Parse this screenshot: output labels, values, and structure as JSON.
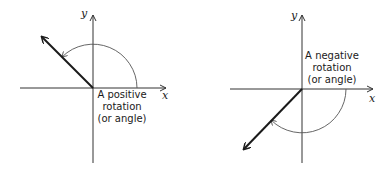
{
  "panels": [
    {
      "id": "positive",
      "axes": {
        "x_label": "x",
        "y_label": "y"
      },
      "caption": [
        "A positive",
        "rotation",
        "(or angle)"
      ],
      "vector_angle_deg": 135,
      "arc_direction": "counterclockwise"
    },
    {
      "id": "negative",
      "axes": {
        "x_label": "x",
        "y_label": "y"
      },
      "caption": [
        "A negative",
        "rotation",
        "(or angle)"
      ],
      "vector_angle_deg": -135,
      "arc_direction": "clockwise"
    }
  ],
  "colors": {
    "stroke": "#1a1a1a",
    "arc": "#555555",
    "background": "#ffffff"
  }
}
